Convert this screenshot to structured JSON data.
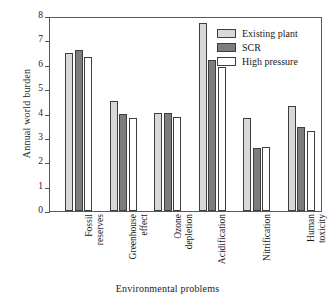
{
  "chart_data": {
    "type": "bar",
    "title": "",
    "xlabel": "Environmental problems",
    "ylabel": "Annual world burden",
    "categories": [
      "Fossil reserves",
      "Greenhouse effect",
      "Ozone depletion",
      "Acidification",
      "Nitrification",
      "Human toxicity"
    ],
    "category_lines": [
      [
        "Fossil",
        "reserves"
      ],
      [
        "Greenhouse",
        "effect"
      ],
      [
        "Ozone",
        "depletion"
      ],
      [
        "Acidification",
        ""
      ],
      [
        "Nitrification",
        ""
      ],
      [
        "Human",
        "toxicity"
      ]
    ],
    "series": [
      {
        "name": "Existing plant",
        "color": "#d8d8d8",
        "values": [
          6.5,
          4.5,
          4.02,
          7.7,
          3.8,
          4.3
        ]
      },
      {
        "name": "SCR",
        "color": "#7d7d7d",
        "values": [
          6.6,
          4.0,
          4.02,
          6.2,
          2.6,
          3.45
        ]
      },
      {
        "name": "High pressure",
        "color": "#ffffff",
        "values": [
          6.3,
          3.8,
          3.85,
          5.9,
          2.62,
          3.3
        ]
      }
    ],
    "ylim": [
      0,
      8
    ],
    "yticks": [
      0,
      1,
      2,
      3,
      4,
      5,
      6,
      7,
      8
    ],
    "ytick_labels": [
      "0",
      "1",
      "2",
      "3",
      "4",
      "5",
      "6",
      "7",
      "8"
    ],
    "grid": false,
    "legend_position": "top-right",
    "bar_outline_color": "#3c3f41",
    "axis_color": "#55595c"
  }
}
